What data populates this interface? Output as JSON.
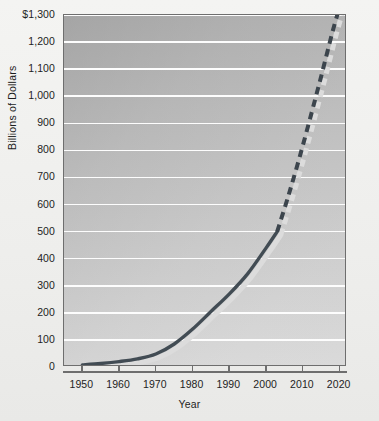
{
  "chart_data": {
    "type": "line",
    "title": "",
    "xlabel": "Year",
    "ylabel": "Billions of Dollars",
    "xlim": [
      1945,
      2022
    ],
    "ylim": [
      0,
      1300
    ],
    "grid": true,
    "legend": "none",
    "y_ticks": [
      "0",
      "100",
      "200",
      "300",
      "400",
      "500",
      "600",
      "700",
      "800",
      "900",
      "1,000",
      "1,100",
      "1,200",
      "$1,300"
    ],
    "y_tick_values": [
      0,
      100,
      200,
      300,
      400,
      500,
      600,
      700,
      800,
      900,
      1000,
      1100,
      1200,
      1300
    ],
    "x_ticks": [
      "1950",
      "1960",
      "1970",
      "1980",
      "1990",
      "2000",
      "2010",
      "2020"
    ],
    "x_tick_values": [
      1950,
      1960,
      1970,
      1980,
      1990,
      2000,
      2010,
      2020
    ],
    "series": [
      {
        "name": "Actual",
        "style": "solid",
        "color": "#424c54",
        "x": [
          1950,
          1955,
          1960,
          1965,
          1970,
          1975,
          1980,
          1985,
          1990,
          1995,
          2000,
          2003
        ],
        "values": [
          8,
          13,
          20,
          30,
          48,
          85,
          140,
          205,
          270,
          345,
          440,
          500
        ]
      },
      {
        "name": "Projected",
        "style": "dashed",
        "color": "#3c454d",
        "x": [
          2003,
          2006,
          2009,
          2012,
          2015,
          2018,
          2020
        ],
        "values": [
          500,
          630,
          770,
          920,
          1075,
          1235,
          1330
        ]
      }
    ],
    "colors": {
      "line": "#424c54",
      "gridline": "#fdfdfd",
      "plot_border": "#6e6e6e",
      "shadow": "#d9d9d9",
      "page_background": "#f2f2f0"
    }
  }
}
